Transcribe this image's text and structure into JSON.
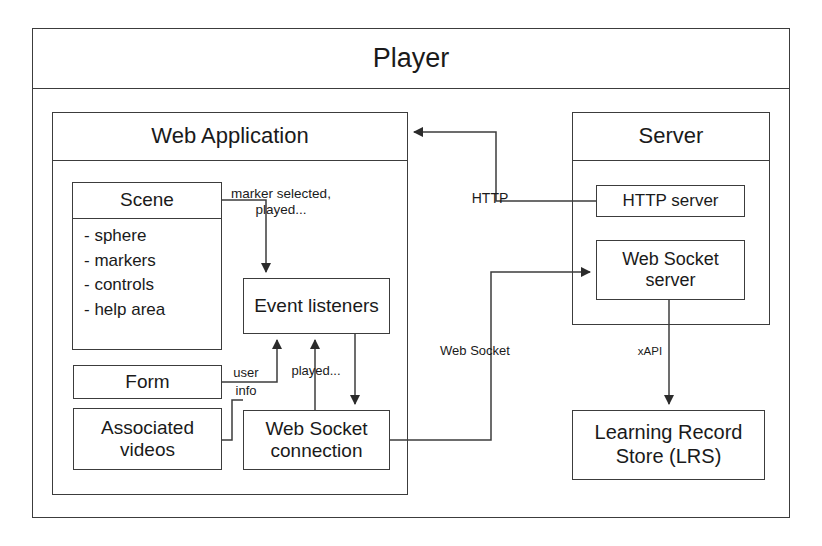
{
  "diagram": {
    "player": {
      "label": "Player"
    },
    "web_application": {
      "label": "Web Application",
      "scene": {
        "label": "Scene",
        "items": [
          "- sphere",
          "- markers",
          "- controls",
          "- help area"
        ]
      },
      "form": {
        "label": "Form"
      },
      "associated_videos": {
        "label": "Associated\nvideos"
      },
      "event_listeners": {
        "label": "Event\nlisteners"
      },
      "web_socket_connection": {
        "label": "Web Socket\nconnection"
      }
    },
    "server": {
      "label": "Server",
      "http_server": {
        "label": "HTTP server"
      },
      "web_socket_server": {
        "label": "Web Socket\nserver"
      }
    },
    "lrs": {
      "label": "Learning Record\nStore (LRS)"
    },
    "edges": {
      "marker_selected": "marker selected,\nplayed...",
      "http": "HTTP",
      "web_socket": "Web Socket",
      "xapi": "xAPI",
      "user_info": "user\ninfo",
      "played": "played..."
    }
  },
  "colors": {
    "stroke": "#3c3c3c",
    "text": "#1a1a1a",
    "background": "#ffffff"
  }
}
